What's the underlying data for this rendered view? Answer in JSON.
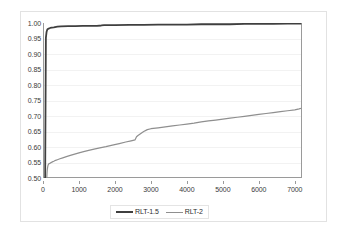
{
  "chart_data": {
    "type": "line",
    "title": "",
    "subtitle": "",
    "xlabel": "",
    "ylabel": "",
    "xlim": [
      0,
      7200
    ],
    "ylim": [
      0.5,
      1.0
    ],
    "grid": true,
    "legend_position": "bottom",
    "y_ticks": [
      "0.50",
      "0.55",
      "0.60",
      "0.65",
      "0.70",
      "0.75",
      "0.80",
      "0.85",
      "0.90",
      "0.95",
      "1.00"
    ],
    "y_tick_values": [
      0.5,
      0.55,
      0.6,
      0.65,
      0.7,
      0.75,
      0.8,
      0.85,
      0.9,
      0.95,
      1.0
    ],
    "x_ticks": [
      "0",
      "1000",
      "2000",
      "3000",
      "4000",
      "5000",
      "6000",
      "7000"
    ],
    "x_tick_values": [
      0,
      1000,
      2000,
      3000,
      4000,
      5000,
      6000,
      7000
    ],
    "series": [
      {
        "name": "RLT-1.5",
        "color": "#3f3f3f",
        "width": 1.8,
        "x": [
          60,
          80,
          100,
          120,
          140,
          160,
          180,
          200,
          240,
          300,
          400,
          500,
          700,
          900,
          1100,
          1300,
          1500,
          1620,
          1700,
          2000,
          2400,
          2800,
          3200,
          3600,
          4000,
          4400,
          4800,
          5200,
          5600,
          6000,
          6400,
          6800,
          7100,
          7180
        ],
        "y": [
          0.5,
          0.952,
          0.972,
          0.979,
          0.981,
          0.982,
          0.983,
          0.984,
          0.985,
          0.986,
          0.988,
          0.989,
          0.99,
          0.99,
          0.991,
          0.991,
          0.991,
          0.992,
          0.993,
          0.993,
          0.994,
          0.994,
          0.995,
          0.995,
          0.995,
          0.996,
          0.996,
          0.996,
          0.997,
          0.997,
          0.997,
          0.998,
          0.998,
          0.998
        ]
      },
      {
        "name": "RLT-2",
        "color": "#8f8f8f",
        "width": 1.2,
        "x": [
          105,
          112,
          120,
          130,
          140,
          150,
          165,
          180,
          200,
          230,
          260,
          300,
          350,
          400,
          470,
          550,
          650,
          760,
          880,
          1000,
          1130,
          1270,
          1420,
          1580,
          1750,
          1930,
          2120,
          2300,
          2450,
          2560,
          2600,
          2640,
          2700,
          2800,
          2900,
          3000,
          3200,
          3400,
          3600,
          3800,
          4000,
          4200,
          4400,
          4600,
          4800,
          5000,
          5200,
          5400,
          5600,
          5800,
          6000,
          6200,
          6400,
          6600,
          6800,
          7000,
          7120,
          7180
        ],
        "y": [
          0.5,
          0.516,
          0.528,
          0.536,
          0.541,
          0.544,
          0.546,
          0.547,
          0.548,
          0.55,
          0.552,
          0.554,
          0.557,
          0.559,
          0.562,
          0.565,
          0.569,
          0.573,
          0.577,
          0.581,
          0.585,
          0.589,
          0.593,
          0.597,
          0.601,
          0.606,
          0.611,
          0.616,
          0.62,
          0.623,
          0.633,
          0.637,
          0.642,
          0.65,
          0.656,
          0.659,
          0.662,
          0.665,
          0.668,
          0.671,
          0.674,
          0.677,
          0.681,
          0.684,
          0.687,
          0.69,
          0.693,
          0.696,
          0.699,
          0.702,
          0.705,
          0.708,
          0.711,
          0.714,
          0.717,
          0.72,
          0.723,
          0.725
        ]
      }
    ]
  },
  "legend": {
    "items": [
      {
        "label": "RLT-1.5",
        "color": "#3f3f3f",
        "thickness": "2px"
      },
      {
        "label": "RLT-2",
        "color": "#8f8f8f",
        "thickness": "1px"
      }
    ]
  },
  "colors": {
    "series_1": "#3f3f3f",
    "series_2": "#8f8f8f",
    "axis": "#9a9a9a",
    "gridline": "#f2f2f2",
    "frame_border": "#e2e2e2",
    "text": "#3a3a3a",
    "background": "#ffffff"
  }
}
